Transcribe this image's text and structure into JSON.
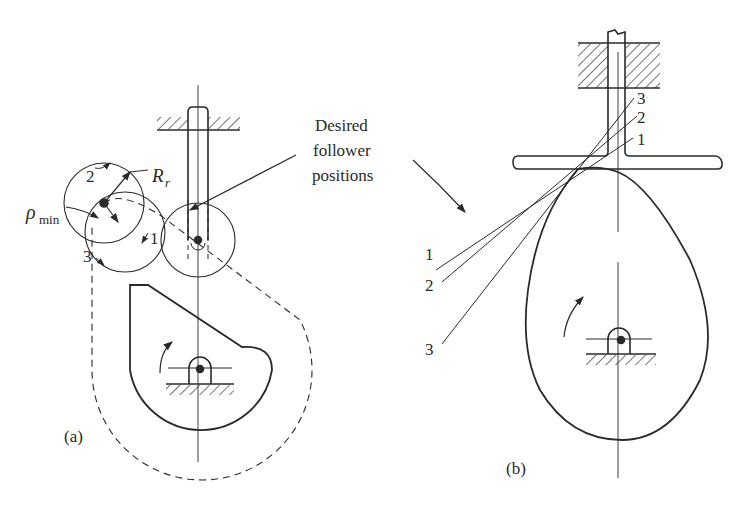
{
  "figure": {
    "panels": [
      {
        "id": "a",
        "label": "(a)",
        "description": "Roller follower on cam with sharp corner; pitch curve dashed"
      },
      {
        "id": "b",
        "label": "(b)",
        "description": "Flat-face follower on egg-shaped cam with three tangent lines"
      }
    ],
    "callout": {
      "line1": "Desired",
      "line2": "follower",
      "line3": "positions"
    },
    "panel_a": {
      "labels": {
        "rho_min": "ρ",
        "rho_sub": "min",
        "roller_radius": "R",
        "roller_radius_sub": "r",
        "pos1": "1",
        "pos2": "2",
        "pos3": "3"
      }
    },
    "panel_b": {
      "labels_right": [
        "3",
        "2",
        "1"
      ],
      "labels_left": [
        "1",
        "2",
        "3"
      ]
    },
    "colors": {
      "ink": "#2a2a2a",
      "background": "#ffffff"
    }
  }
}
